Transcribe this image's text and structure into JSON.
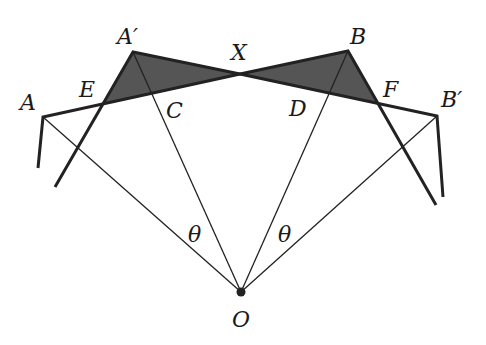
{
  "diagram": {
    "colors": {
      "line": "#222222",
      "shade": "#555555",
      "background": "#ffffff"
    },
    "labels": {
      "A": "A",
      "A_prime": "A′",
      "B": "B",
      "B_prime": "B′",
      "C": "C",
      "D": "D",
      "E": "E",
      "F": "F",
      "X": "X",
      "O": "O",
      "theta_left": "θ",
      "theta_right": "θ"
    },
    "points": {
      "A": [
        43,
        117
      ],
      "A_prime": [
        133,
        52
      ],
      "B": [
        348,
        51
      ],
      "B_prime": [
        437,
        116
      ],
      "C": [
        153,
        93
      ],
      "D": [
        330,
        92
      ],
      "E": [
        102,
        104
      ],
      "F": [
        378,
        103
      ],
      "X": [
        240,
        74
      ],
      "O": [
        241,
        292
      ]
    },
    "shaded_regions": [
      "triangle A'EX",
      "triangle BFX"
    ]
  }
}
